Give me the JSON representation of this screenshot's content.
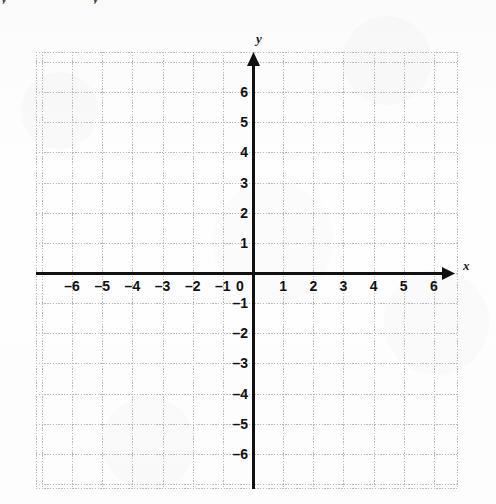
{
  "page": {
    "background_color": "#fdfdfd",
    "partial_top_text": "y            y"
  },
  "chart_data": {
    "type": "scatter",
    "title": "",
    "subtitle": "",
    "xlabel": "x",
    "ylabel": "y",
    "xlim": [
      -7,
      7
    ],
    "ylim": [
      -7.2,
      6.8
    ],
    "grid": true,
    "grid_color": "#b9b9bd",
    "grid_style": "dotted",
    "axis_color": "#111111",
    "legend": null,
    "series": [],
    "x_ticks": [
      -6,
      -5,
      -4,
      -3,
      -2,
      -1,
      0,
      1,
      2,
      3,
      4,
      5,
      6
    ],
    "y_ticks": [
      6,
      5,
      4,
      3,
      2,
      1,
      -1,
      -2,
      -3,
      -4,
      -5,
      -6
    ],
    "x_tick_labels": [
      "–6",
      "–5",
      "–4",
      "–3",
      "–2",
      "–1",
      "0",
      "1",
      "2",
      "3",
      "4",
      "5",
      "6"
    ],
    "y_tick_labels": [
      "6",
      "5",
      "4",
      "3",
      "2",
      "1",
      "–1",
      "–2",
      "–3",
      "–4",
      "–5",
      "–6"
    ],
    "origin_label": "0",
    "annotations": [],
    "data_points": []
  },
  "axes": {
    "x_axis_label": "x",
    "y_axis_label": "y",
    "x_arrow": "arrow-right",
    "y_arrow": "arrow-up"
  },
  "ticks": {
    "x": [
      {
        "value": -6,
        "label": "–6"
      },
      {
        "value": -5,
        "label": "–5"
      },
      {
        "value": -4,
        "label": "–4"
      },
      {
        "value": -3,
        "label": "–3"
      },
      {
        "value": -2,
        "label": "–2"
      },
      {
        "value": -1,
        "label": "–1"
      },
      {
        "value": 1,
        "label": "1"
      },
      {
        "value": 2,
        "label": "2"
      },
      {
        "value": 3,
        "label": "3"
      },
      {
        "value": 4,
        "label": "4"
      },
      {
        "value": 5,
        "label": "5"
      },
      {
        "value": 6,
        "label": "6"
      }
    ],
    "y": [
      {
        "value": 6,
        "label": "6"
      },
      {
        "value": 5,
        "label": "5"
      },
      {
        "value": 4,
        "label": "4"
      },
      {
        "value": 3,
        "label": "3"
      },
      {
        "value": 2,
        "label": "2"
      },
      {
        "value": 1,
        "label": "1"
      },
      {
        "value": -1,
        "label": "–1"
      },
      {
        "value": -2,
        "label": "–2"
      },
      {
        "value": -3,
        "label": "–3"
      },
      {
        "value": -4,
        "label": "–4"
      },
      {
        "value": -5,
        "label": "–5"
      },
      {
        "value": -6,
        "label": "–6"
      }
    ],
    "origin": "0"
  },
  "geometry": {
    "grid_left": 36,
    "grid_top": 52,
    "grid_right": 458,
    "grid_bottom": 489,
    "origin_x": 253,
    "origin_y": 273,
    "cell": 30.15
  }
}
